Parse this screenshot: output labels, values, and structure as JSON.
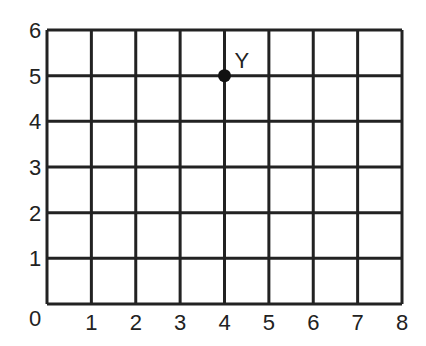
{
  "chart_data": {
    "type": "scatter",
    "title": "",
    "xlabel": "",
    "ylabel": "",
    "xlim": [
      0,
      8
    ],
    "ylim": [
      0,
      6
    ],
    "grid": true,
    "x_ticks": [
      "0",
      "1",
      "2",
      "3",
      "4",
      "5",
      "6",
      "7",
      "8"
    ],
    "y_ticks": [
      "0",
      "1",
      "2",
      "3",
      "4",
      "5",
      "6"
    ],
    "points": [
      {
        "label": "Y",
        "x": 4,
        "y": 5
      }
    ]
  },
  "colors": {
    "line": "#222222",
    "background": "#ffffff"
  }
}
